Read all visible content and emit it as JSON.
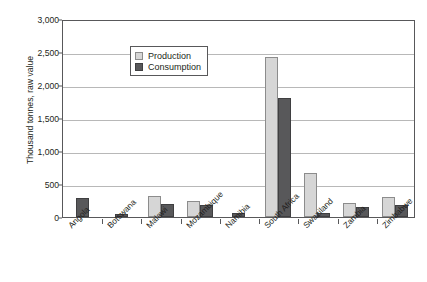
{
  "chart_data": {
    "type": "bar",
    "title": "",
    "xlabel": "",
    "ylabel": "Thousand tonnes, raw value",
    "ylim": [
      0,
      3000
    ],
    "ytick_labels": [
      "3,000",
      "2,500",
      "2,000",
      "1,500",
      "1,000",
      "500",
      "0"
    ],
    "ytick_values": [
      3000,
      2500,
      2000,
      1500,
      1000,
      500,
      0
    ],
    "grid": true,
    "legend_position": "top-left",
    "categories": [
      "Angola",
      "Botswana",
      "Malawi",
      "Mozambique",
      "Namibia",
      "South Africa",
      "Swaziland",
      "Zambia",
      "Zimbabwe"
    ],
    "series": [
      {
        "name": "Production",
        "color": "#d6d6d6",
        "values": [
          0,
          0,
          320,
          250,
          0,
          2420,
          670,
          210,
          300
        ]
      },
      {
        "name": "Consumption",
        "color": "#58585a",
        "values": [
          290,
          50,
          190,
          175,
          60,
          1810,
          60,
          150,
          175
        ]
      }
    ]
  },
  "legend": {
    "items": [
      {
        "label": "Production",
        "swatch": "prod"
      },
      {
        "label": "Consumption",
        "swatch": "cons"
      }
    ]
  },
  "colors": {
    "production": "#d6d6d6",
    "consumption": "#58585a",
    "axis": "#58585a",
    "gridline": "#b8b8b8",
    "text": "#231f20"
  }
}
